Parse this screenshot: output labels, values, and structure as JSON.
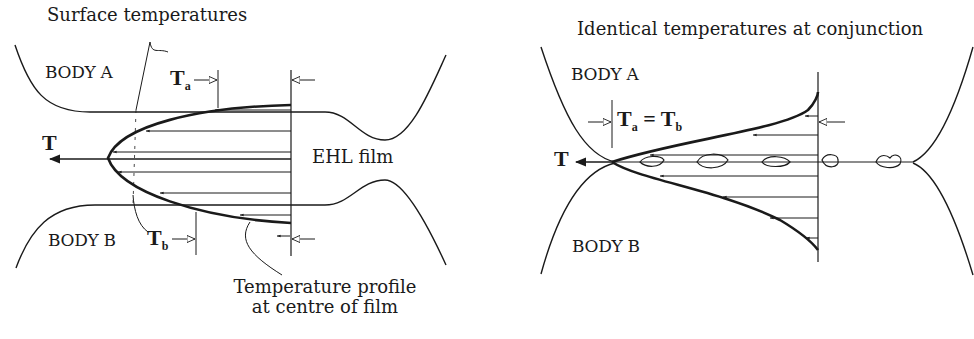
{
  "left_figure": {
    "callout_surface": "Surface temperatures",
    "body_a": "BODY A",
    "body_b": "BODY B",
    "ta_symbol": "T",
    "ta_sub": "a",
    "tb_symbol": "T",
    "tb_sub": "b",
    "t_axis": "T",
    "film_label": "EHL film",
    "callout_profile_line1": "Temperature profile",
    "callout_profile_line2": "at centre of film"
  },
  "right_figure": {
    "title": "Identical temperatures at conjunction",
    "body_a": "BODY A",
    "body_b": "BODY B",
    "t_axis": "T",
    "eq_t1": "T",
    "eq_sub1": "a",
    "eq_mid": " = ",
    "eq_t2": "T",
    "eq_sub2": "b"
  },
  "colors": {
    "ink": "#1a1a1a",
    "background": "#ffffff"
  }
}
